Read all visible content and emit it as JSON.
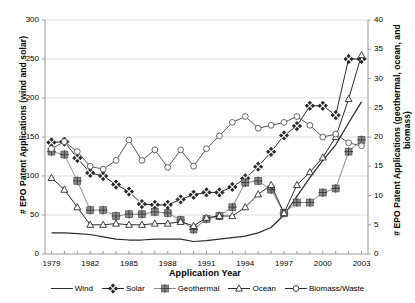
{
  "chart_data": {
    "type": "line",
    "title": "",
    "xlabel": "Application Year",
    "ylabel": "# EPO Patent Applications (wind and solar)",
    "y2label": "# EPO Patent Applications (geothermal, ocean, and biomass)",
    "x": [
      1979,
      1980,
      1981,
      1982,
      1983,
      1984,
      1985,
      1986,
      1987,
      1988,
      1989,
      1990,
      1991,
      1992,
      1993,
      1994,
      1995,
      1996,
      1997,
      1998,
      1999,
      2000,
      2001,
      2002,
      2003
    ],
    "xlim": [
      1978.5,
      2003.5
    ],
    "xticks": [
      1979,
      1982,
      1985,
      1988,
      1991,
      1994,
      1997,
      2000,
      2003
    ],
    "ylim": [
      0,
      300
    ],
    "yticks": [
      0,
      50,
      100,
      150,
      200,
      250,
      300
    ],
    "y2lim": [
      0,
      40
    ],
    "y2ticks": [
      0,
      5,
      10,
      15,
      20,
      25,
      30,
      35,
      40
    ],
    "grid": true,
    "legend_position": "bottom",
    "series": [
      {
        "name": "Wind",
        "axis": "left",
        "marker": "none",
        "color": "#2b2b2b",
        "values": [
          27,
          27,
          26,
          25,
          22,
          19,
          18,
          18,
          19,
          19,
          19,
          16,
          17,
          19,
          21,
          23,
          27,
          34,
          50,
          74,
          98,
          120,
          140,
          168,
          195
        ]
      },
      {
        "name": "Solar",
        "axis": "left",
        "marker": "diamond-x",
        "color": "#2b2b2b",
        "values": [
          143,
          144,
          123,
          104,
          100,
          89,
          80,
          64,
          63,
          63,
          70,
          76,
          79,
          79,
          86,
          97,
          112,
          131,
          152,
          164,
          190,
          190,
          178,
          250,
          250
        ]
      },
      {
        "name": "Geothermal",
        "axis": "right",
        "marker": "square-cross",
        "color": "#8c8c8c",
        "values": [
          17.5,
          17.0,
          12.5,
          7.5,
          7.5,
          6.5,
          6.8,
          6.8,
          7.2,
          7.0,
          5.8,
          4.2,
          6.0,
          6.5,
          8.0,
          12.2,
          12.5,
          11.0,
          7.0,
          8.8,
          8.8,
          10.5,
          11.2,
          17.5,
          19.5
        ]
      },
      {
        "name": "Ocean",
        "axis": "right",
        "marker": "triangle",
        "color": "#2b2b2b",
        "values": [
          13.0,
          11.0,
          8.0,
          5.0,
          5.0,
          5.2,
          5.0,
          5.0,
          5.2,
          5.2,
          5.5,
          4.8,
          6.2,
          6.5,
          6.5,
          8.0,
          10.2,
          11.8,
          7.0,
          11.8,
          14.0,
          16.5,
          20.0,
          26.5,
          34.0
        ]
      },
      {
        "name": "Biomass/Waste",
        "axis": "right",
        "marker": "circle-open",
        "color": "#555555",
        "values": [
          18.0,
          19.2,
          17.5,
          15.0,
          14.5,
          16.0,
          19.5,
          16.0,
          17.8,
          14.8,
          17.8,
          15.0,
          18.0,
          20.2,
          22.5,
          23.5,
          21.5,
          22.0,
          22.5,
          23.5,
          22.0,
          20.0,
          20.5,
          19.0,
          18.5
        ]
      }
    ]
  },
  "legend": {
    "items": [
      {
        "label": "Wind",
        "marker": "line"
      },
      {
        "label": "Solar",
        "marker": "diamond-x"
      },
      {
        "label": "Geothermal",
        "marker": "square-cross"
      },
      {
        "label": "Ocean",
        "marker": "triangle"
      },
      {
        "label": "Biomass/Waste",
        "marker": "circle-open"
      }
    ]
  },
  "colors": {
    "grid": "#d4d4d4",
    "axis": "#9a9a9a",
    "dark": "#2b2b2b",
    "gray": "#8c8c8c"
  }
}
